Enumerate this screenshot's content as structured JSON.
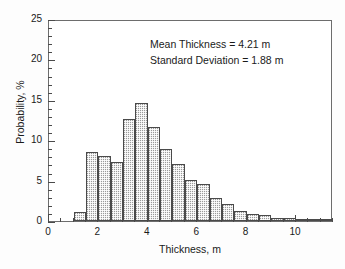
{
  "chart_data": {
    "type": "bar",
    "title": "",
    "xlabel": "Thickness, m",
    "ylabel": "Probability, %",
    "xlim": [
      0,
      11.5
    ],
    "ylim": [
      0,
      25
    ],
    "xticks": [
      0,
      2,
      4,
      6,
      8,
      10
    ],
    "yticks": [
      0,
      5,
      10,
      15,
      20,
      25
    ],
    "xtick_labels": [
      "0",
      "2",
      "4",
      "6",
      "8",
      "10"
    ],
    "ytick_labels": [
      "0",
      "5",
      "10",
      "15",
      "20",
      "25"
    ],
    "x_minor_step": 0.5,
    "y_minor_step": 1,
    "grid": false,
    "legend": null,
    "bin_width": 0.5,
    "bin_starts": [
      1.0,
      1.5,
      2.0,
      2.5,
      3.0,
      3.5,
      4.0,
      4.5,
      5.0,
      5.5,
      6.0,
      6.5,
      7.0,
      7.5,
      8.0,
      8.5,
      9.0,
      9.5,
      10.0,
      10.5,
      11.0
    ],
    "categories": [
      "1.0-1.5",
      "1.5-2.0",
      "2.0-2.5",
      "2.5-3.0",
      "3.0-3.5",
      "3.5-4.0",
      "4.0-4.5",
      "4.5-5.0",
      "5.0-5.5",
      "5.5-6.0",
      "6.0-6.5",
      "6.5-7.0",
      "7.0-7.5",
      "7.5-8.0",
      "8.0-8.5",
      "8.5-9.0",
      "9.0-9.5",
      "9.5-10.0",
      "10.0-10.5",
      "10.5-11.0",
      "11.0-11.5"
    ],
    "values": [
      1.1,
      8.5,
      8.0,
      7.3,
      12.6,
      14.6,
      11.6,
      8.9,
      7.0,
      5.1,
      4.6,
      2.9,
      2.1,
      1.3,
      0.9,
      0.8,
      0.4,
      0.35,
      0.2,
      0.1,
      0.1
    ],
    "annotations": [
      "Mean Thickness = 4.21 m",
      "Standard Deviation = 1.88 m"
    ],
    "bar_face_color": "#9a9a9a",
    "bar_edge_color": "#4a4a4a",
    "axis_color": "#6d6d6d",
    "background_color": "#ffffff"
  }
}
